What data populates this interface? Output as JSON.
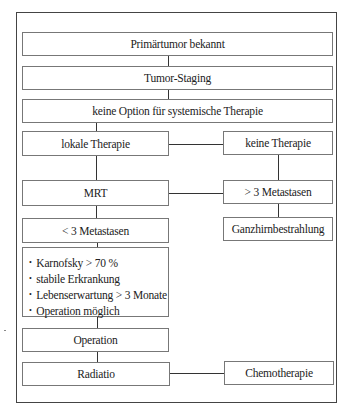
{
  "diagram": {
    "type": "flowchart",
    "nodes": {
      "primaertumor": "Primärtumor bekannt",
      "staging": "Tumor-Staging",
      "keine_option": "keine Option für systemische Therapie",
      "lokale_therapie": "lokale Therapie",
      "keine_therapie": "keine Therapie",
      "mrt": "MRT",
      "mehr_3_metastasen": "> 3 Metastasen",
      "weniger_3_metastasen": "< 3 Metastasen",
      "ganzhirn": "Ganzhirnbestrahlung",
      "criteria": [
        "Karnofsky > 70 %",
        "stabile Erkrankung",
        "Lebenserwartung > 3 Monate",
        "Operation möglich"
      ],
      "bullet": "•",
      "operation": "Operation",
      "radiatio": "Radiatio",
      "chemotherapie": "Chemotherapie"
    },
    "edges": [
      [
        "primaertumor",
        "staging"
      ],
      [
        "staging",
        "keine_option"
      ],
      [
        "keine_option",
        "lokale_therapie"
      ],
      [
        "lokale_therapie",
        "keine_therapie"
      ],
      [
        "lokale_therapie",
        "mrt"
      ],
      [
        "keine_therapie",
        "mehr_3_metastasen"
      ],
      [
        "mrt",
        "mehr_3_metastasen"
      ],
      [
        "mehr_3_metastasen",
        "ganzhirn"
      ],
      [
        "mrt",
        "weniger_3_metastasen"
      ],
      [
        "weniger_3_metastasen",
        "criteria"
      ],
      [
        "criteria",
        "operation"
      ],
      [
        "operation",
        "radiatio"
      ],
      [
        "radiatio",
        "chemotherapie"
      ]
    ]
  }
}
